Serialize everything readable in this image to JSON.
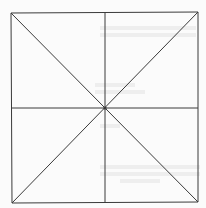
{
  "figure": {
    "kind": "square with midlines and diagonals",
    "stroke_color": "#3a3a3a",
    "background_color": "#fbfbfb",
    "bleed_color": "#e4e4e4",
    "square": {
      "x1": 11,
      "y1": 13,
      "x2": 198,
      "y2": 202
    },
    "center": {
      "x": 105,
      "y": 108
    },
    "lines": [
      {
        "name": "top-edge",
        "x1": 11,
        "y1": 13,
        "x2": 198,
        "y2": 12
      },
      {
        "name": "right-edge",
        "x1": 198,
        "y1": 12,
        "x2": 198,
        "y2": 202
      },
      {
        "name": "bottom-edge",
        "x1": 12,
        "y1": 203,
        "x2": 198,
        "y2": 202
      },
      {
        "name": "left-edge",
        "x1": 11,
        "y1": 13,
        "x2": 12,
        "y2": 203
      },
      {
        "name": "vertical-midline",
        "x1": 105,
        "y1": 13,
        "x2": 105,
        "y2": 203
      },
      {
        "name": "horizontal-midline",
        "x1": 11,
        "y1": 108,
        "x2": 198,
        "y2": 108
      },
      {
        "name": "diagonal-tl-br",
        "x1": 11,
        "y1": 13,
        "x2": 198,
        "y2": 202
      },
      {
        "name": "diagonal-tr-bl",
        "x1": 198,
        "y1": 12,
        "x2": 12,
        "y2": 203
      }
    ]
  }
}
